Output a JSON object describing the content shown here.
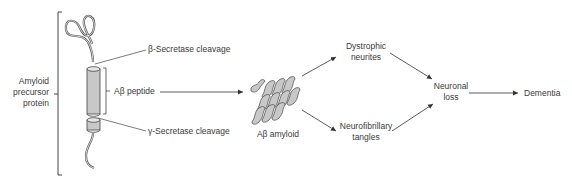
{
  "diagram": {
    "type": "flow",
    "nodes": {
      "app": {
        "label_lines": [
          "Amyloid",
          "precursor",
          "protein"
        ]
      },
      "beta_cleavage": {
        "label": "β-Secretase cleavage"
      },
      "gamma_cleavage": {
        "label": "γ-Secretase cleavage"
      },
      "abeta_peptide": {
        "label": "Aβ peptide"
      },
      "abeta_amyloid": {
        "label": "Aβ amyloid"
      },
      "dystrophic": {
        "label_lines": [
          "Dystrophic",
          "neurites"
        ]
      },
      "nft": {
        "label_lines": [
          "Neurofibrillary",
          "tangles"
        ]
      },
      "neuronal_loss": {
        "label_lines": [
          "Neuronal",
          "loss"
        ]
      },
      "dementia": {
        "label": "Dementia"
      }
    },
    "edges": [
      {
        "from": "abeta_peptide",
        "to": "abeta_amyloid"
      },
      {
        "from": "abeta_amyloid",
        "to": "dystrophic"
      },
      {
        "from": "abeta_amyloid",
        "to": "nft"
      },
      {
        "from": "dystrophic",
        "to": "neuronal_loss"
      },
      {
        "from": "nft",
        "to": "neuronal_loss"
      },
      {
        "from": "neuronal_loss",
        "to": "dementia"
      }
    ],
    "colors": {
      "line": "#333333",
      "fill": "#c8c8c8",
      "text": "#3a3a3a"
    }
  }
}
